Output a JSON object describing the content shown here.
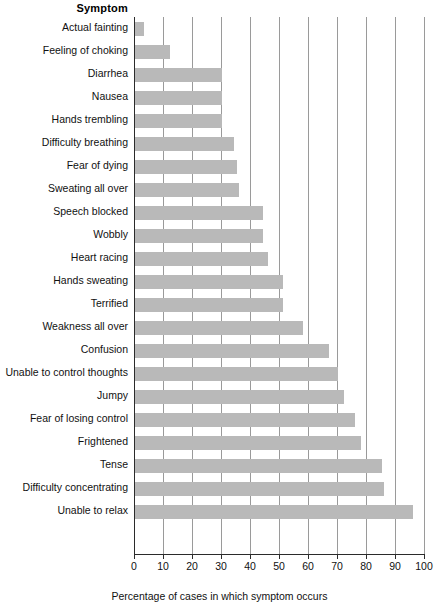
{
  "header": {
    "category_header": "Symptom"
  },
  "axis": {
    "x_title": "Percentage of cases in which symptom occurs",
    "tick_labels": [
      "0",
      "10",
      "20",
      "30",
      "40",
      "50",
      "60",
      "70",
      "80",
      "90",
      "100"
    ]
  },
  "style": {
    "bar_color": "#b9b9b9",
    "gridline_color": "#9a9a9a",
    "axis_color": "#2b2b2b",
    "background": "#ffffff"
  },
  "chart_data": {
    "type": "bar",
    "orientation": "horizontal",
    "title": "",
    "xlabel": "Percentage of cases in which symptom occurs",
    "ylabel": "Symptom",
    "xlim": [
      0,
      100
    ],
    "xticks": [
      0,
      10,
      20,
      30,
      40,
      50,
      60,
      70,
      80,
      90,
      100
    ],
    "grid": "vertical",
    "legend": "none",
    "categories": [
      "Actual fainting",
      "Feeling of choking",
      "Diarrhea",
      "Nausea",
      "Hands trembling",
      "Difficulty breathing",
      "Fear of dying",
      "Sweating all over",
      "Speech blocked",
      "Wobbly",
      "Heart racing",
      "Hands sweating",
      "Terrified",
      "Weakness all over",
      "Confusion",
      "Unable to control thoughts",
      "Jumpy",
      "Fear of losing control",
      "Frightened",
      "Tense",
      "Difficulty concentrating",
      "Unable to relax"
    ],
    "values": [
      3,
      12,
      30,
      30,
      30,
      34,
      35,
      36,
      44,
      44,
      46,
      51,
      51,
      58,
      67,
      70,
      72,
      76,
      78,
      85,
      86,
      96
    ]
  }
}
